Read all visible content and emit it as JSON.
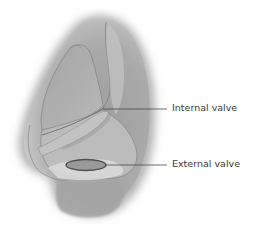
{
  "figure": {
    "labels": [
      {
        "id": "internal",
        "text": "Internal valve"
      },
      {
        "id": "external",
        "text": "External valve"
      }
    ]
  },
  "colors": {
    "background": "#ffffff",
    "skin_dark": "#8c8c8c",
    "skin_mid": "#a8a8a8",
    "skin_light": "#c8c8c8",
    "cartilage": "#b0b0b0",
    "outline": "#6e6e6e",
    "leader_line": "#4a4a4a",
    "label_text": "#3a3a3a",
    "valve_fill": "#9a9a9a",
    "valve_stroke": "#505050"
  }
}
